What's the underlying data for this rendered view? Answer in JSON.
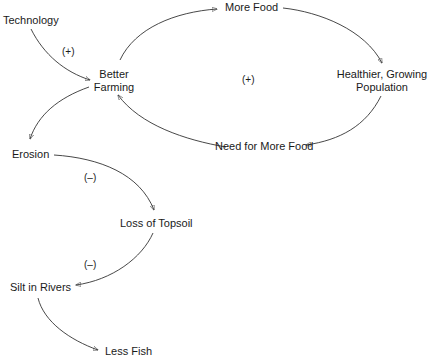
{
  "diagram": {
    "type": "causal-loop",
    "nodes": {
      "technology": "Technology",
      "better_farming_line1": "Better",
      "better_farming_line2": "Farming",
      "more_food": "More Food",
      "healthier_line1": "Healthier, Growing",
      "healthier_line2": "Population",
      "need_more_food": "Need for More Food",
      "erosion": "Erosion",
      "loss_topsoil": "Loss of Topsoil",
      "silt_rivers": "Silt in Rivers",
      "less_fish": "Less Fish"
    },
    "signs": {
      "technology_to_farming": "(+)",
      "loop": "(+)",
      "erosion_to_topsoil": "(–)",
      "topsoil_to_silt": "(–)"
    },
    "edges": [
      {
        "from": "Technology",
        "to": "Better Farming",
        "polarity": "+"
      },
      {
        "from": "Better Farming",
        "to": "More Food"
      },
      {
        "from": "More Food",
        "to": "Healthier, Growing Population"
      },
      {
        "from": "Healthier, Growing Population",
        "to": "Need for More Food"
      },
      {
        "from": "Need for More Food",
        "to": "Better Farming"
      },
      {
        "from": "Better Farming",
        "to": "Erosion"
      },
      {
        "from": "Erosion",
        "to": "Loss of Topsoil",
        "polarity": "-"
      },
      {
        "from": "Loss of Topsoil",
        "to": "Silt in Rivers",
        "polarity": "-"
      },
      {
        "from": "Silt in Rivers",
        "to": "Less Fish"
      }
    ],
    "loop_polarity": "+"
  }
}
